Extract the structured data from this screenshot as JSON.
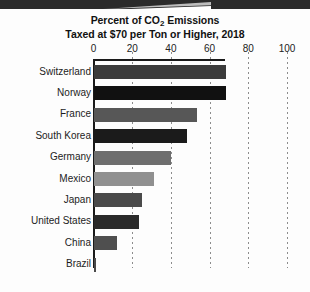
{
  "chart_data": {
    "type": "bar",
    "orientation": "horizontal",
    "title": "Percent of CO2 Emissions Taxed at $70 per Ton or Higher, 2018",
    "title_line1_pre": "Percent of CO",
    "title_line1_sub": "2",
    "title_line1_post": " Emissions",
    "title_line2": "Taxed at $70 per Ton or Higher, 2018",
    "xlabel": "",
    "ylabel": "",
    "xlim": [
      0,
      100
    ],
    "xticks": [
      0,
      20,
      40,
      60,
      80,
      100
    ],
    "xtick_labels": [
      "0",
      "20",
      "40",
      "60",
      "80",
      "100"
    ],
    "grid": "vertical-dotted",
    "axis_position": "top",
    "legend": "none",
    "categories": [
      "Switzerland",
      "Norway",
      "France",
      "South Korea",
      "Germany",
      "Mexico",
      "Japan",
      "United States",
      "China",
      "Brazil"
    ],
    "values": [
      68,
      68,
      53,
      48,
      40,
      31,
      25,
      23,
      12,
      1
    ],
    "bar_colors": [
      "#3b3b3b",
      "#111111",
      "#575757",
      "#1b1b1b",
      "#6e6e6e",
      "#909090",
      "#4a4a4a",
      "#2a2a2a",
      "#4f4f4f",
      "#4a4a4a"
    ]
  },
  "colors": {
    "background": "#fdfdfd",
    "axis": "#1a1a1a",
    "gridline": "#8c8c8c",
    "title_text": "#111111",
    "label_text": "#1c1c1c",
    "scan_band": "#2b2b2b"
  }
}
